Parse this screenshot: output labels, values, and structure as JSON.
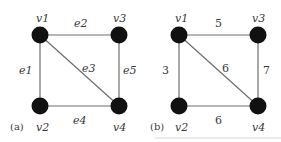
{
  "figure": {
    "panels": [
      {
        "id": "a",
        "caption": "(a)",
        "vertices": [
          {
            "name": "v1",
            "label": "v1",
            "x": 40,
            "y": 35
          },
          {
            "name": "v2",
            "label": "v2",
            "x": 40,
            "y": 106
          },
          {
            "name": "v3",
            "label": "v3",
            "x": 119,
            "y": 35
          },
          {
            "name": "v4",
            "label": "v4",
            "x": 119,
            "y": 106
          }
        ],
        "edges": [
          {
            "from": "v1",
            "to": "v2",
            "label": "e1"
          },
          {
            "from": "v1",
            "to": "v3",
            "label": "e2"
          },
          {
            "from": "v1",
            "to": "v4",
            "label": "e3"
          },
          {
            "from": "v2",
            "to": "v4",
            "label": "e4"
          },
          {
            "from": "v3",
            "to": "v4",
            "label": "e5"
          }
        ]
      },
      {
        "id": "b",
        "caption": "(b)",
        "vertices": [
          {
            "name": "v1",
            "label": "v1",
            "x": 179,
            "y": 35
          },
          {
            "name": "v2",
            "label": "v2",
            "x": 179,
            "y": 106
          },
          {
            "name": "v3",
            "label": "v3",
            "x": 258,
            "y": 35
          },
          {
            "name": "v4",
            "label": "v4",
            "x": 258,
            "y": 106
          }
        ],
        "edges": [
          {
            "from": "v1",
            "to": "v2",
            "label": "3"
          },
          {
            "from": "v1",
            "to": "v3",
            "label": "5"
          },
          {
            "from": "v1",
            "to": "v4",
            "label": "6"
          },
          {
            "from": "v2",
            "to": "v4",
            "label": "6"
          },
          {
            "from": "v3",
            "to": "v4",
            "label": "7"
          }
        ]
      }
    ]
  }
}
